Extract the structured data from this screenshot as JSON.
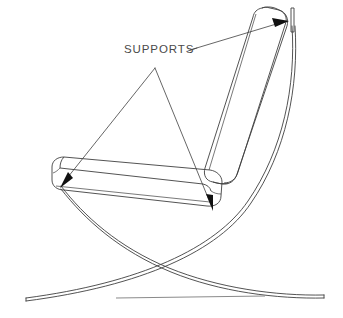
{
  "figure": {
    "type": "technical-line-drawing",
    "background_color": "#ffffff",
    "line_color": "#3f3f3f",
    "text_color": "#4a4a4a",
    "width": 343,
    "height": 318
  },
  "annotations": {
    "label": "SUPPORTS",
    "label_position": {
      "x": 124,
      "y": 52
    },
    "leader_vertex": {
      "x": 155,
      "y": 68
    },
    "arrow_targets": [
      {
        "name": "backrest-top-support",
        "x": 285,
        "y": 22
      },
      {
        "name": "seat-front-support",
        "x": 62,
        "y": 184
      },
      {
        "name": "seat-rear-support",
        "x": 213,
        "y": 208
      }
    ]
  },
  "parts": {
    "backrest_cushion": "backrest-cushion",
    "seat_cushion": "seat-cushion",
    "frame_rail_rear": "rear-curved-rail",
    "frame_rail_front": "front-curved-rail",
    "top_bracket": "top-vertical-support-bracket",
    "ground_line": "ground-reference-line"
  }
}
